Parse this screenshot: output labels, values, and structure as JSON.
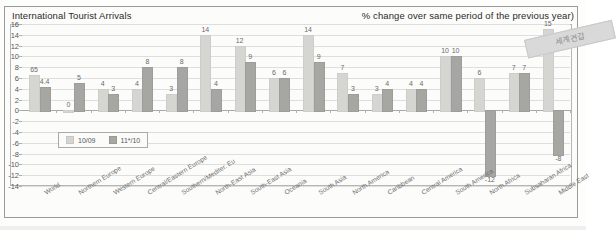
{
  "header": {
    "title": "International Tourist Arrivals",
    "subtitle": "% change over same period of the previous year)"
  },
  "watermark": {
    "text": "세계견갑"
  },
  "legend": {
    "items": [
      {
        "label": "10/09",
        "color": "#d5d5d2"
      },
      {
        "label": "11*/10",
        "color": "#a6a6a3"
      }
    ]
  },
  "chart_data": {
    "type": "bar",
    "title": "International Tourist Arrivals",
    "subtitle": "% change over same period of the previous year)",
    "xlabel": "",
    "ylabel": "",
    "ylim": [
      -14,
      16
    ],
    "ytick_step": 2,
    "yticks": [
      16,
      14,
      12,
      10,
      8,
      6,
      4,
      2,
      0,
      -2,
      -4,
      -6,
      -8,
      -10,
      -12,
      -14
    ],
    "grid": true,
    "legend_position": "inside-left",
    "categories": [
      "World",
      "Northern Europe",
      "Western Europe",
      "Central/Eastern Europe",
      "Southern/Mediter. Eu",
      "North-East Asia",
      "South-East Asia",
      "Oceania",
      "South Asia",
      "North America",
      "Caribbean",
      "Central America",
      "South America",
      "North Africa",
      "Subsaharan Africa",
      "Middle East"
    ],
    "series": [
      {
        "name": "10/09",
        "color": "#d5d5d2",
        "values": [
          6.5,
          0,
          4,
          4,
          3,
          14,
          12,
          6,
          14,
          7,
          3,
          4,
          10,
          6,
          7,
          15
        ],
        "labels": [
          "65",
          "0",
          "4",
          "4",
          "3",
          "14",
          "12",
          "6",
          "14",
          "7",
          "3",
          "4",
          "10",
          "6",
          "7",
          "15"
        ]
      },
      {
        "name": "11*/10",
        "color": "#a6a6a3",
        "values": [
          4.4,
          5,
          3,
          8,
          8,
          4,
          9,
          6,
          9,
          3,
          4,
          4,
          10,
          -12,
          7,
          -8
        ],
        "labels": [
          "4.4",
          "5",
          "3",
          "8",
          "8",
          "4",
          "9",
          "6",
          "9",
          "3",
          "4",
          "4",
          "10",
          "-12",
          "7",
          "-8"
        ]
      }
    ]
  }
}
